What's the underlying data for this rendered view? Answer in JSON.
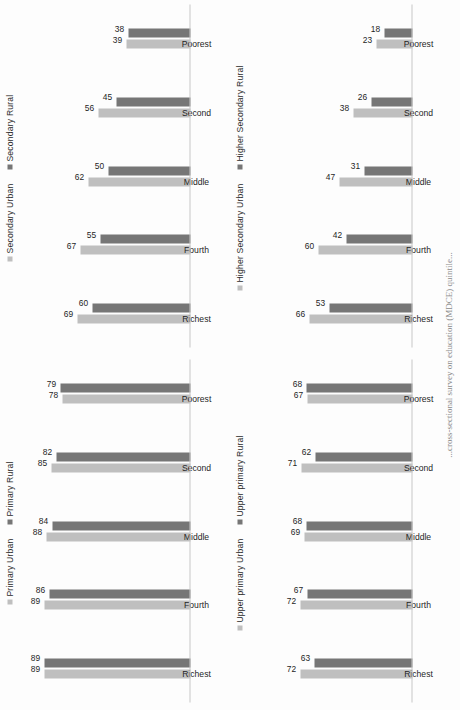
{
  "page": {
    "orientation": "rotated-90-ccw",
    "caption": "...cross-sectional survey on education (MDCE) quintile..."
  },
  "colors": {
    "urban": "#bfbfbf",
    "rural": "#767676",
    "axis": "#c8c8c8",
    "label": "#1f1f1f"
  },
  "charts": [
    {
      "id": "secondary",
      "position": "top-left",
      "chart_data": {
        "type": "bar",
        "title": "",
        "xlabel": "",
        "ylabel": "",
        "ylim": [
          0,
          100
        ],
        "grid": false,
        "legend_position": "top",
        "categories": [
          "Richest",
          "Fourth",
          "Middle",
          "Second",
          "Poorest"
        ],
        "series": [
          {
            "name": "Secondary Urban",
            "color": "#bfbfbf",
            "values": [
              69,
              67,
              62,
              56,
              39
            ]
          },
          {
            "name": "Secondary Rural",
            "color": "#767676",
            "values": [
              60,
              55,
              50,
              45,
              38
            ]
          }
        ]
      }
    },
    {
      "id": "higher-secondary",
      "position": "top-right",
      "chart_data": {
        "type": "bar",
        "title": "",
        "xlabel": "",
        "ylabel": "",
        "ylim": [
          0,
          100
        ],
        "grid": false,
        "legend_position": "top",
        "categories": [
          "Richest",
          "Fourth",
          "Middle",
          "Second",
          "Poorest"
        ],
        "series": [
          {
            "name": "Higher Secondary Urban",
            "color": "#bfbfbf",
            "values": [
              66,
              60,
              47,
              38,
              23
            ]
          },
          {
            "name": "Higher Secondary Rural",
            "color": "#767676",
            "values": [
              53,
              42,
              31,
              26,
              18
            ]
          }
        ]
      }
    },
    {
      "id": "primary",
      "position": "bottom-left",
      "chart_data": {
        "type": "bar",
        "title": "",
        "xlabel": "",
        "ylabel": "",
        "ylim": [
          0,
          100
        ],
        "grid": false,
        "legend_position": "top",
        "categories": [
          "Richest",
          "Fourth",
          "Middle",
          "Second",
          "Poorest"
        ],
        "series": [
          {
            "name": "Primary Urban",
            "color": "#bfbfbf",
            "values": [
              89,
              89,
              88,
              85,
              78
            ]
          },
          {
            "name": "Primary Rural",
            "color": "#767676",
            "values": [
              89,
              86,
              84,
              82,
              79
            ]
          }
        ]
      }
    },
    {
      "id": "upper-primary",
      "position": "bottom-right",
      "chart_data": {
        "type": "bar",
        "title": "",
        "xlabel": "",
        "ylabel": "",
        "ylim": [
          0,
          100
        ],
        "grid": false,
        "legend_position": "top",
        "categories": [
          "Richest",
          "Fourth",
          "Middle",
          "Second",
          "Poorest"
        ],
        "series": [
          {
            "name": "Upper primary Urban",
            "color": "#bfbfbf",
            "values": [
              72,
              72,
              69,
              71,
              67
            ]
          },
          {
            "name": "Upper primary Rural",
            "color": "#767676",
            "values": [
              63,
              67,
              68,
              62,
              68
            ]
          }
        ]
      }
    }
  ]
}
